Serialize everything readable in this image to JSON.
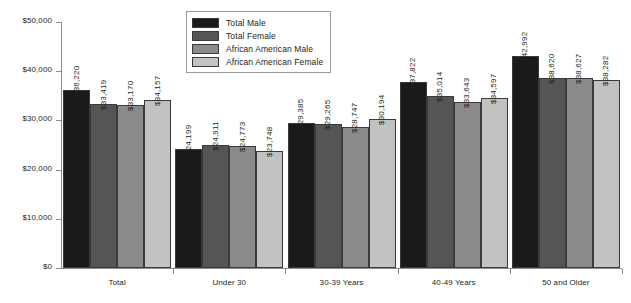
{
  "chart_data": {
    "type": "bar",
    "title": "",
    "xlabel": "",
    "ylabel": "",
    "ylim": [
      0,
      50000
    ],
    "ytick_labels": [
      "$0",
      "$10,000",
      "$20,000",
      "$30,000",
      "$40,000",
      "$50,000"
    ],
    "ytick_values": [
      0,
      10000,
      20000,
      30000,
      40000,
      50000
    ],
    "grid": false,
    "legend_position": "top-center",
    "categories": [
      "Total",
      "Under 30",
      "30-39 Years",
      "40-49 Years",
      "50 and Older"
    ],
    "series": [
      {
        "name": "Total Male",
        "color": "#1a1a1a",
        "values": [
          36220,
          24199,
          29385,
          37822,
          42992
        ],
        "labels": [
          "$36,220",
          "$24,199",
          "$29,385",
          "$37,822",
          "$42,992"
        ]
      },
      {
        "name": "Total Female",
        "color": "#555555",
        "values": [
          33419,
          24911,
          29265,
          35014,
          38620
        ],
        "labels": [
          "$33,419",
          "$24,911",
          "$29,265",
          "$35,014",
          "$38,620"
        ]
      },
      {
        "name": "African American Male",
        "color": "#8a8a8a",
        "values": [
          33170,
          24773,
          28747,
          33643,
          38627
        ],
        "labels": [
          "$33,170",
          "$24,773",
          "$28,747",
          "$33,643",
          "$38,627"
        ]
      },
      {
        "name": "African American Female",
        "color": "#c2c2c2",
        "values": [
          34157,
          23748,
          30194,
          34597,
          38282
        ],
        "labels": [
          "$34,157",
          "$23,748",
          "$30,194",
          "$34,597",
          "$38,282"
        ]
      }
    ]
  },
  "legend": {
    "items": [
      {
        "label": "Total Male",
        "color": "#1a1a1a"
      },
      {
        "label": "Total Female",
        "color": "#555555"
      },
      {
        "label": "African American Male",
        "color": "#8a8a8a"
      },
      {
        "label": "African American Female",
        "color": "#c2c2c2"
      }
    ]
  }
}
